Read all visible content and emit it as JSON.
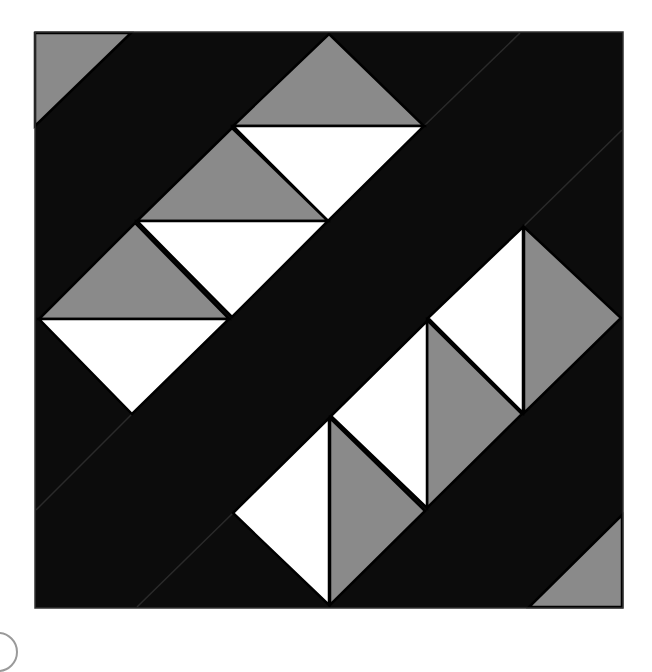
{
  "diagram": {
    "type": "quilt-block",
    "colors": {
      "background": "#0c0c0c",
      "grey": "#8a8a8a",
      "white": "#ffffff",
      "outline": "#000000",
      "seam": "#2a2a2a"
    },
    "block": {
      "x": 35,
      "y": 32,
      "width": 588,
      "height": 576
    },
    "corner_triangles": [
      {
        "name": "corner-triangle-top-left",
        "fill": "grey",
        "points": "35,33 131,33 35,126"
      },
      {
        "name": "corner-triangle-bottom-right",
        "fill": "grey",
        "points": "622,515 622,607 529,607"
      }
    ],
    "upper_band_triangles": [
      {
        "name": "upper-grey-1",
        "fill": "grey",
        "points": "329,34 424,126 233,126"
      },
      {
        "name": "upper-white-1",
        "fill": "white",
        "points": "233,126 424,126 328,221"
      },
      {
        "name": "upper-grey-2",
        "fill": "grey",
        "points": "232,128 328,221 137,221"
      },
      {
        "name": "upper-white-2",
        "fill": "white",
        "points": "137,221 328,221 232,317"
      },
      {
        "name": "upper-grey-3",
        "fill": "grey",
        "points": "135,223 229,319 39,319"
      },
      {
        "name": "upper-white-3",
        "fill": "white",
        "points": "39,319 229,319 132,414"
      }
    ],
    "lower_band_triangles": [
      {
        "name": "lower-white-1",
        "fill": "white",
        "points": "523,227 523,413 428,318"
      },
      {
        "name": "lower-grey-1",
        "fill": "grey",
        "points": "524,227 621,318 524,413"
      },
      {
        "name": "lower-grey-2",
        "fill": "grey",
        "points": "427,320 522,414 427,508"
      },
      {
        "name": "lower-white-2",
        "fill": "white",
        "points": "427,321 427,508 331,416"
      },
      {
        "name": "lower-grey-3",
        "fill": "grey",
        "points": "330,418 425,511 330,605"
      },
      {
        "name": "lower-white-3",
        "fill": "white",
        "points": "329,418 329,605 233,513"
      }
    ],
    "seams": [
      {
        "name": "seam-top",
        "x1": 520,
        "y1": 33,
        "x2": 424,
        "y2": 126
      },
      {
        "name": "seam-right",
        "x1": 622,
        "y1": 130,
        "x2": 523,
        "y2": 227
      },
      {
        "name": "seam-left",
        "x1": 132,
        "y1": 414,
        "x2": 36,
        "y2": 510
      },
      {
        "name": "seam-bottom",
        "x1": 233,
        "y1": 513,
        "x2": 137,
        "y2": 607
      }
    ]
  }
}
